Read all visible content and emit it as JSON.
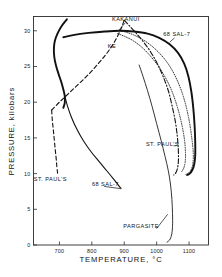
{
  "chart_data": {
    "type": "line",
    "title": "",
    "xlabel": "TEMPERATURE, °C",
    "ylabel": "PRESSURE, kilobars",
    "xlim": [
      620,
      1160
    ],
    "ylim": [
      0,
      32
    ],
    "grid": false,
    "legend_position": "inline-annotations",
    "xticks": [
      700,
      800,
      900,
      1000,
      1100
    ],
    "xtick_labels": [
      "700",
      "800",
      "900",
      "1000",
      "1100"
    ],
    "yticks": [
      0,
      5,
      10,
      15,
      20,
      25,
      30
    ],
    "ytick_labels": [
      "0",
      "5",
      "10",
      "15",
      "20",
      "25",
      "30"
    ],
    "annotations": [
      {
        "text": "KAKANUI",
        "x": 905,
        "y": 31.4
      },
      {
        "text": "KE",
        "x": 862,
        "y": 27.6
      },
      {
        "text": "68 SAL-7",
        "x": 1062,
        "y": 29.2
      },
      {
        "text": "ST. PAUL'S",
        "x": 1018,
        "y": 13.9
      },
      {
        "text": "ST. PAUL'S",
        "x": 672,
        "y": 9.0
      },
      {
        "text": "68 SAL-7",
        "x": 842,
        "y": 8.2
      },
      {
        "text": "PARGASITE",
        "x": 952,
        "y": 2.4
      }
    ],
    "series": [
      {
        "name": "68 SAL-7 solidus",
        "style": "solid-thick",
        "points": [
          [
            723,
            31.6
          ],
          [
            706,
            30.6
          ],
          [
            694,
            29.6
          ],
          [
            686,
            28.6
          ],
          [
            683,
            27.6
          ],
          [
            684,
            26.4
          ],
          [
            689,
            25.2
          ],
          [
            697,
            24.0
          ],
          [
            706,
            22.8
          ],
          [
            712,
            21.8
          ],
          [
            716,
            21.0
          ],
          [
            717,
            20.4
          ],
          [
            716,
            19.8
          ],
          [
            712,
            19.2
          ]
        ]
      },
      {
        "name": "68 SAL-7 upper solidus loop",
        "style": "solid-thick",
        "points": [
          [
            712,
            29.1
          ],
          [
            742,
            29.4
          ],
          [
            790,
            29.7
          ],
          [
            840,
            29.9
          ],
          [
            886,
            30.0
          ],
          [
            930,
            29.9
          ],
          [
            972,
            29.6
          ],
          [
            1008,
            29.0
          ],
          [
            1040,
            28.1
          ],
          [
            1066,
            26.9
          ],
          [
            1085,
            25.4
          ],
          [
            1098,
            23.6
          ],
          [
            1107,
            21.5
          ],
          [
            1113,
            19.2
          ],
          [
            1117,
            16.8
          ],
          [
            1119,
            14.5
          ],
          [
            1119,
            12.5
          ],
          [
            1116,
            11.3
          ],
          [
            1110,
            10.5
          ],
          [
            1102,
            10.0
          ],
          [
            1094,
            9.8
          ]
        ]
      },
      {
        "name": "68 SAL-7 liquidus descending",
        "style": "solid-med",
        "points": [
          [
            716,
            21.0
          ],
          [
            724,
            19.6
          ],
          [
            737,
            17.9
          ],
          [
            754,
            16.2
          ],
          [
            774,
            14.6
          ],
          [
            797,
            13.1
          ],
          [
            822,
            11.7
          ],
          [
            846,
            10.4
          ],
          [
            866,
            9.3
          ],
          [
            880,
            8.5
          ],
          [
            890,
            7.9
          ]
        ]
      },
      {
        "name": "ST. PAUL'S left dashed",
        "style": "dashed",
        "points": [
          [
            676,
            18.9
          ],
          [
            678,
            17.5
          ],
          [
            681,
            16.2
          ],
          [
            684,
            14.8
          ],
          [
            687,
            13.4
          ],
          [
            690,
            12.1
          ],
          [
            692,
            11.0
          ],
          [
            694,
            10.2
          ],
          [
            695,
            9.7
          ]
        ]
      },
      {
        "name": "KE dashed ascending",
        "style": "dashed",
        "points": [
          [
            676,
            18.9
          ],
          [
            700,
            20.0
          ],
          [
            728,
            21.2
          ],
          [
            758,
            22.5
          ],
          [
            788,
            23.8
          ],
          [
            816,
            25.2
          ],
          [
            842,
            26.6
          ],
          [
            864,
            28.0
          ],
          [
            880,
            29.3
          ],
          [
            892,
            30.5
          ],
          [
            900,
            31.5
          ]
        ]
      },
      {
        "name": "KAKANUI dotted",
        "style": "dotted",
        "points": [
          [
            886,
            30.0
          ],
          [
            906,
            29.8
          ],
          [
            930,
            29.4
          ],
          [
            956,
            28.8
          ],
          [
            984,
            27.9
          ],
          [
            1012,
            26.7
          ],
          [
            1038,
            25.2
          ],
          [
            1060,
            23.4
          ],
          [
            1078,
            21.4
          ],
          [
            1092,
            19.2
          ],
          [
            1102,
            17.0
          ],
          [
            1109,
            14.8
          ],
          [
            1113,
            12.9
          ],
          [
            1112,
            11.5
          ],
          [
            1107,
            10.6
          ],
          [
            1099,
            10.1
          ],
          [
            1090,
            9.9
          ]
        ]
      },
      {
        "name": "KAKANUI dotted inner",
        "style": "dotted",
        "points": [
          [
            880,
            29.6
          ],
          [
            902,
            29.2
          ],
          [
            928,
            28.6
          ],
          [
            954,
            27.7
          ],
          [
            980,
            26.5
          ],
          [
            1006,
            25.0
          ],
          [
            1030,
            23.2
          ],
          [
            1050,
            21.2
          ],
          [
            1066,
            19.0
          ],
          [
            1078,
            16.8
          ],
          [
            1086,
            14.7
          ],
          [
            1089,
            12.9
          ],
          [
            1088,
            11.6
          ],
          [
            1083,
            10.7
          ],
          [
            1076,
            10.2
          ]
        ]
      },
      {
        "name": "ST. PAUL'S right dash-dot",
        "style": "dash-dot",
        "points": [
          [
            900,
            31.5
          ],
          [
            918,
            30.6
          ],
          [
            938,
            29.6
          ],
          [
            960,
            28.4
          ],
          [
            982,
            27.0
          ],
          [
            1002,
            25.4
          ],
          [
            1020,
            23.6
          ],
          [
            1036,
            21.6
          ],
          [
            1048,
            19.4
          ],
          [
            1058,
            17.2
          ],
          [
            1064,
            15.1
          ],
          [
            1067,
            13.2
          ],
          [
            1067,
            11.7
          ],
          [
            1064,
            10.7
          ],
          [
            1059,
            10.1
          ],
          [
            1053,
            9.8
          ]
        ]
      },
      {
        "name": "PARGASITE thin",
        "style": "solid-thin",
        "points": [
          [
            946,
            25.2
          ],
          [
            958,
            23.6
          ],
          [
            972,
            21.6
          ],
          [
            986,
            19.4
          ],
          [
            1000,
            17.0
          ],
          [
            1014,
            14.6
          ],
          [
            1026,
            12.4
          ],
          [
            1036,
            10.4
          ],
          [
            1043,
            8.4
          ],
          [
            1047,
            6.4
          ],
          [
            1049,
            4.4
          ],
          [
            1049,
            2.6
          ],
          [
            1046,
            1.4
          ],
          [
            1040,
            0.7
          ],
          [
            1032,
            0.4
          ]
        ]
      }
    ],
    "leader_lines": [
      {
        "name": "kakanui-leader",
        "x1": 903,
        "y1": 31.1,
        "x2": 880,
        "y2": 29.9
      },
      {
        "name": "st-pauls-right-leader",
        "x1": 1052,
        "y1": 13.9,
        "x2": 1062,
        "y2": 13.9
      },
      {
        "name": "pargasite-leader",
        "x1": 1000,
        "y1": 2.3,
        "x2": 1034,
        "y2": 4.3
      },
      {
        "name": "sal7-right-leader",
        "x1": 1055,
        "y1": 29.0,
        "x2": 1040,
        "y2": 28.4
      },
      {
        "name": "sal7-bottom-leader",
        "x1": 838,
        "y1": 8.2,
        "x2": 888,
        "y2": 7.9
      }
    ]
  }
}
